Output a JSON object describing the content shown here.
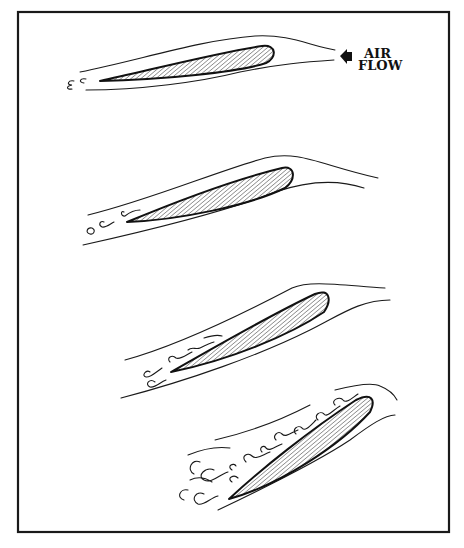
{
  "diagram": {
    "title": "",
    "labels": {
      "airflow_line1": "AIR",
      "airflow_line2": "FLOW"
    },
    "icons": {
      "airflow_arrow": "arrow-left-icon"
    },
    "colors": {
      "ink": "#111111",
      "background": "#ffffff",
      "hatch": "#333333"
    },
    "panels": [
      {
        "id": "airfoil-1",
        "description": "Low angle of attack, smooth streamline flow, minimal wake"
      },
      {
        "id": "airfoil-2",
        "description": "Increased angle of attack, small eddies forming at trailing edge"
      },
      {
        "id": "airfoil-3",
        "description": "Higher angle of attack, turbulence spreading along upper surface"
      },
      {
        "id": "airfoil-4",
        "description": "Stall: flow separated, heavy turbulence over upper surface"
      }
    ]
  }
}
